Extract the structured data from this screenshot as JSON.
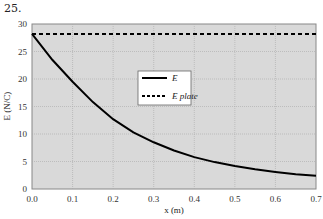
{
  "problem_number": "25.",
  "chart_data": {
    "type": "line",
    "title": "",
    "xlabel": "x (m)",
    "ylabel": "E (N/C)",
    "xlim": [
      0,
      0.7
    ],
    "ylim": [
      0,
      30
    ],
    "x_ticks": [
      "0.0",
      "0.1",
      "0.2",
      "0.3",
      "0.4",
      "0.5",
      "0.6",
      "0.7"
    ],
    "y_ticks": [
      "0",
      "5",
      "10",
      "15",
      "20",
      "25",
      "30"
    ],
    "grid": true,
    "legend_position": "center-right inside plot",
    "series": [
      {
        "name": "E",
        "style": "solid",
        "x": [
          0,
          0.05,
          0.1,
          0.15,
          0.2,
          0.25,
          0.3,
          0.35,
          0.4,
          0.45,
          0.5,
          0.55,
          0.6,
          0.65,
          0.7
        ],
        "values": [
          28.2,
          23.5,
          19.5,
          15.8,
          12.7,
          10.3,
          8.5,
          7.0,
          5.8,
          4.9,
          4.2,
          3.6,
          3.1,
          2.7,
          2.4
        ]
      },
      {
        "name": "E plate",
        "style": "dashed",
        "x": [
          0,
          0.7
        ],
        "values": [
          28.2,
          28.2
        ]
      }
    ]
  },
  "legend": {
    "items": [
      "E",
      "E plate"
    ]
  }
}
